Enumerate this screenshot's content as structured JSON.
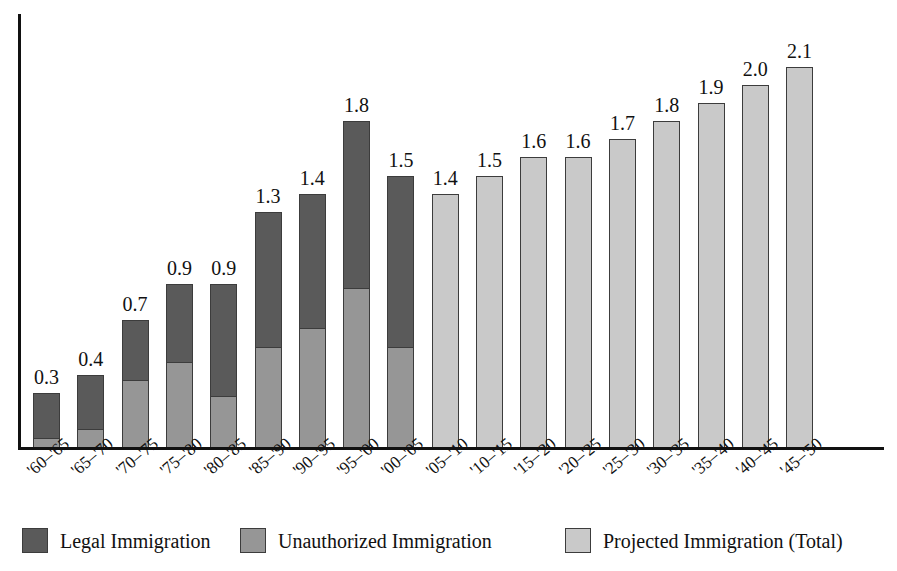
{
  "chart_data": {
    "type": "bar",
    "subtype": "stacked-bar",
    "title": "",
    "xlabel": "",
    "ylabel": "",
    "ylim": [
      0,
      2.4
    ],
    "grid": false,
    "units": "millions per year",
    "legend_position": "bottom",
    "categories": [
      "'60–'65",
      "'65–'70",
      "'70–'75",
      "'75–'80",
      "'80–'85",
      "'85–'90",
      "'90–'95",
      "'95–'00",
      "'00–'05",
      "'05–'10",
      "'10–'15",
      "'15–'20",
      "'20–'25",
      "'25–'30",
      "'30–'35",
      "'35–'40",
      "'40–'45",
      "'45–'50"
    ],
    "series": [
      {
        "name": "Legal Immigration",
        "color": "#5a5a5a",
        "values": [
          0.25,
          0.3,
          0.33,
          0.43,
          0.62,
          0.75,
          0.74,
          0.92,
          0.95,
          null,
          null,
          null,
          null,
          null,
          null,
          null,
          null,
          null
        ]
      },
      {
        "name": "Unauthorized Immigration",
        "color": "#969696",
        "values": [
          0.05,
          0.1,
          0.37,
          0.47,
          0.28,
          0.55,
          0.66,
          0.88,
          0.55,
          null,
          null,
          null,
          null,
          null,
          null,
          null,
          null,
          null
        ]
      },
      {
        "name": "Projected Immigration (Total)",
        "color": "#c9c9c9",
        "values": [
          null,
          null,
          null,
          null,
          null,
          null,
          null,
          null,
          null,
          1.4,
          1.5,
          1.6,
          1.6,
          1.7,
          1.8,
          1.9,
          2.0,
          2.1
        ]
      }
    ],
    "totals": [
      0.3,
      0.4,
      0.7,
      0.9,
      0.9,
      1.3,
      1.4,
      1.8,
      1.5,
      1.4,
      1.5,
      1.6,
      1.6,
      1.7,
      1.8,
      1.9,
      2.0,
      2.1
    ],
    "value_labels": [
      "0.3",
      "0.4",
      "0.7",
      "0.9",
      "0.9",
      "1.3",
      "1.4",
      "1.8",
      "1.5",
      "1.4",
      "1.5",
      "1.6",
      "1.6",
      "1.7",
      "1.8",
      "1.9",
      "2.0",
      "2.1"
    ]
  },
  "legend": {
    "items": [
      {
        "label": "Legal Immigration",
        "color": "#5a5a5a"
      },
      {
        "label": "Unauthorized Immigration",
        "color": "#969696"
      },
      {
        "label": "Projected Immigration (Total)",
        "color": "#c9c9c9"
      }
    ]
  },
  "axes": {
    "y_axis_color": "#111111",
    "x_axis_color": "#111111"
  }
}
